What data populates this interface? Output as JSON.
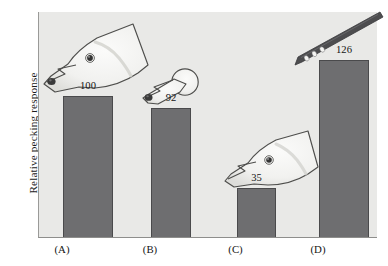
{
  "chart_data": {
    "type": "bar",
    "title": "",
    "xlabel": "",
    "ylabel": "Relative pecking response",
    "categories": [
      "(A)",
      "(B)",
      "(C)",
      "(D)"
    ],
    "values": [
      100,
      92,
      35,
      126
    ],
    "value_labels": [
      "100",
      "92",
      "35",
      "126"
    ],
    "ylim": [
      0,
      160
    ],
    "grid": false,
    "legend": "none",
    "axis_ticks_visible": false,
    "series": [
      {
        "name": "Relative pecking response",
        "values": [
          100,
          92,
          35,
          126
        ]
      }
    ],
    "annotations": [
      {
        "category": "(A)",
        "icon": "gull-head-with-beak-spot",
        "description": "Realistic herring gull head, pointing down-left, dark spot near beak tip"
      },
      {
        "category": "(B)",
        "icon": "simplified-round-head-with-beak-spot",
        "description": "Simplified round head with beak and dark spot near beak tip"
      },
      {
        "category": "(C)",
        "icon": "gull-head-without-beak-spot",
        "description": "Realistic herring gull head with no spot on the beak"
      },
      {
        "category": "(D)",
        "icon": "banded-rod-stimulus",
        "description": "Thin pointed rod with three white bands near the tip (supernormal stimulus)"
      }
    ]
  },
  "figure": {
    "bar_color": "#6e6e70",
    "bar_outline_color": "#4a4a4c",
    "panel_background": "#e9e9e7",
    "page_background": "#ffffff",
    "axis_color": "#8e8e8c",
    "text_color": "#151515"
  },
  "axis": {
    "y_title": "Relative pecking response"
  },
  "bars": [
    {
      "label": "(A)",
      "value": 100,
      "value_label": "100"
    },
    {
      "label": "(B)",
      "value": 92,
      "value_label": "92"
    },
    {
      "label": "(C)",
      "value": 35,
      "value_label": "35"
    },
    {
      "label": "(D)",
      "value": 126,
      "value_label": "126"
    }
  ]
}
